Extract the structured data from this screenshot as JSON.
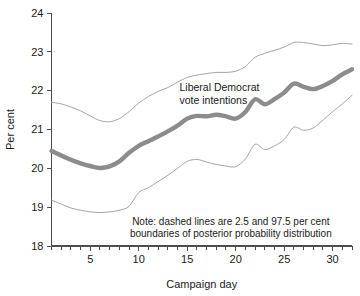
{
  "chart_data": {
    "type": "line",
    "title": "",
    "xlabel": "Campaign day",
    "ylabel": "Per cent",
    "xlim": [
      1,
      32
    ],
    "ylim": [
      18,
      24
    ],
    "grid": false,
    "legend_position": "inline-annotation",
    "yticks": [
      18,
      19,
      20,
      21,
      22,
      23,
      24
    ],
    "ytick_labels": [
      "18",
      "19",
      "20",
      "21",
      "22",
      "23",
      "24"
    ],
    "xticks": [
      5,
      10,
      15,
      20,
      25,
      30
    ],
    "xtick_labels": [
      "5",
      "10",
      "15",
      "20",
      "25",
      "30"
    ],
    "xminorticks": [
      1,
      2,
      3,
      4,
      5,
      6,
      7,
      8,
      9,
      10,
      11,
      12,
      13,
      14,
      15,
      16,
      17,
      18,
      19,
      20,
      21,
      22,
      23,
      24,
      25,
      26,
      27,
      28,
      29,
      30,
      31,
      32
    ],
    "annotations": [
      {
        "name": "series-label",
        "lines": [
          "Liberal Democrat",
          "vote intentions"
        ],
        "x": 14.2,
        "y": 22.0
      },
      {
        "name": "note",
        "lines": [
          "Note: dashed lines are 2.5 and 97.5 per cent",
          "boundaries of posterior probability distribution"
        ],
        "x": 19.5,
        "y": 18.55
      }
    ],
    "x": [
      1,
      2,
      3,
      4,
      5,
      6,
      7,
      8,
      9,
      10,
      11,
      12,
      13,
      14,
      15,
      16,
      17,
      18,
      19,
      20,
      21,
      22,
      23,
      24,
      25,
      26,
      27,
      28,
      29,
      30,
      31,
      32
    ],
    "series": [
      {
        "name": "Liberal Democrat vote intentions (posterior mean)",
        "style": "solid-thick",
        "color": "#8c8c8c",
        "values": [
          20.45,
          20.33,
          20.22,
          20.13,
          20.06,
          20.01,
          20.05,
          20.18,
          20.4,
          20.58,
          20.7,
          20.82,
          20.95,
          21.1,
          21.28,
          21.35,
          21.34,
          21.38,
          21.34,
          21.28,
          21.45,
          21.78,
          21.65,
          21.78,
          21.95,
          22.18,
          22.1,
          22.04,
          22.12,
          22.25,
          22.42,
          22.55
        ]
      },
      {
        "name": "97.5 per cent boundary",
        "style": "thin",
        "color": "#9a9a9a",
        "values": [
          21.7,
          21.66,
          21.58,
          21.48,
          21.35,
          21.23,
          21.2,
          21.28,
          21.46,
          21.68,
          21.85,
          21.98,
          22.08,
          22.22,
          22.34,
          22.4,
          22.44,
          22.47,
          22.47,
          22.5,
          22.62,
          22.86,
          22.96,
          23.04,
          23.12,
          23.24,
          23.24,
          23.2,
          23.16,
          23.18,
          23.22,
          23.2
        ]
      },
      {
        "name": "2.5 per cent boundary",
        "style": "thin",
        "color": "#9a9a9a",
        "values": [
          19.18,
          19.08,
          18.98,
          18.92,
          18.88,
          18.86,
          18.88,
          18.92,
          19.02,
          19.38,
          19.5,
          19.66,
          19.82,
          20.0,
          20.18,
          20.23,
          20.16,
          20.1,
          20.06,
          20.04,
          20.24,
          20.62,
          20.48,
          20.58,
          20.74,
          21.06,
          20.98,
          21.04,
          21.24,
          21.46,
          21.66,
          21.88
        ]
      }
    ]
  }
}
